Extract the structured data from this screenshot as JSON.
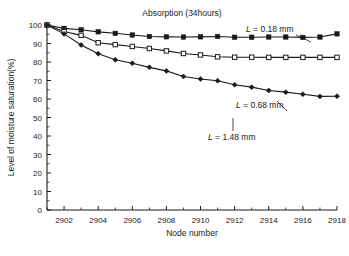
{
  "chart_data": {
    "type": "line",
    "title": "Absorption (34hours)",
    "xlabel": "Node number",
    "ylabel": "Level of moisture saturation(%)",
    "xlim": [
      2901,
      2918
    ],
    "ylim": [
      0,
      100
    ],
    "xticks": [
      2902,
      2904,
      2906,
      2908,
      2910,
      2912,
      2914,
      2916,
      2918
    ],
    "xtick_labels": [
      "2902",
      "2904",
      "2906",
      "2908",
      "2910",
      "2912",
      "2914",
      "2916",
      "2918"
    ],
    "x_minor_step": 1,
    "yticks": [
      0,
      10,
      20,
      30,
      40,
      50,
      60,
      70,
      80,
      90,
      100
    ],
    "ytick_labels": [
      "0",
      "10",
      "20",
      "30",
      "40",
      "50",
      "60",
      "70",
      "80",
      "90",
      "100"
    ],
    "grid": false,
    "legend": "annotations",
    "x": [
      2901,
      2902,
      2903,
      2904,
      2905,
      2906,
      2907,
      2908,
      2909,
      2910,
      2911,
      2912,
      2913,
      2914,
      2915,
      2916,
      2917,
      2918
    ],
    "series": [
      {
        "name": "L = 0.18 mm",
        "marker": "filled-square",
        "color": "#1a1a1a",
        "values": [
          100.0,
          98.2,
          97.4,
          96.3,
          95.5,
          94.6,
          93.8,
          93.6,
          93.5,
          93.6,
          93.8,
          93.4,
          93.4,
          93.5,
          93.5,
          93.3,
          93.5,
          95.2
        ]
      },
      {
        "name": "L = 0.68 mm",
        "marker": "open-square",
        "color": "#1a1a1a",
        "values": [
          100.0,
          96.5,
          94.4,
          90.4,
          89.4,
          88.4,
          87.3,
          86.0,
          84.6,
          83.8,
          82.8,
          82.6,
          82.6,
          82.5,
          82.5,
          82.5,
          82.5,
          82.5
        ]
      },
      {
        "name": "L = 1.48 mm",
        "marker": "filled-diamond",
        "color": "#1a1a1a",
        "values": [
          100.0,
          95.2,
          89.2,
          84.5,
          81.2,
          79.3,
          77.1,
          75.2,
          72.2,
          70.8,
          69.9,
          67.7,
          66.4,
          64.6,
          63.7,
          62.6,
          61.4,
          61.5
        ]
      }
    ],
    "annotations": [
      {
        "name": "label-l018",
        "prefix": "L",
        "text": " = 0.18 mm",
        "attach_x": 2916,
        "attach_y": 93.3
      },
      {
        "name": "label-l068",
        "prefix": "L",
        "text": " = 0.68 mm",
        "attach_x": 2913,
        "attach_y": 82.6
      },
      {
        "name": "label-l148",
        "prefix": "L",
        "text": " = 1.48 mm",
        "attach_x": 2911,
        "attach_y": 69.9
      }
    ]
  }
}
